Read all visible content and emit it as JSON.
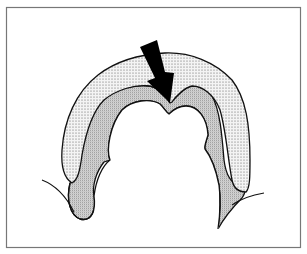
{
  "figure": {
    "type": "anatomical-line-drawing",
    "frame": {
      "x": 6,
      "y": 7,
      "width": 295,
      "height": 241,
      "stroke": "#777777"
    },
    "colors": {
      "background": "#ffffff",
      "outline": "#111111",
      "outer_band_fill": "#e6e6e6",
      "inner_band_fill": "#cfcfcf",
      "arrow": "#000000"
    },
    "elements": [
      {
        "name": "outer-stippled-band",
        "pattern": "sparse-dots"
      },
      {
        "name": "inner-stippled-band",
        "pattern": "dense-stipple"
      },
      {
        "name": "indicator-arrow",
        "direction": "down-right",
        "points_to": "central-notch"
      },
      {
        "name": "left-contour-line"
      },
      {
        "name": "right-contour-line"
      }
    ]
  }
}
